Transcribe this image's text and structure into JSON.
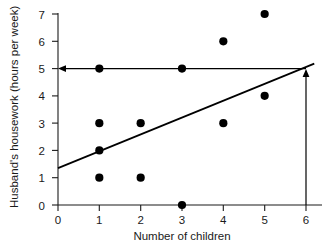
{
  "chart_data": {
    "type": "scatter",
    "title": "",
    "xlabel": "Number of children",
    "ylabel": "Husband's housework (hours per week)",
    "xlim": [
      0,
      6
    ],
    "ylim": [
      0,
      7
    ],
    "xticks": [
      "0",
      "1",
      "2",
      "3",
      "4",
      "5",
      "6"
    ],
    "yticks": [
      "0",
      "1",
      "2",
      "3",
      "4",
      "5",
      "6",
      "7"
    ],
    "grid": false,
    "legend": "none",
    "points": [
      {
        "x": 1,
        "y": 5
      },
      {
        "x": 1,
        "y": 3
      },
      {
        "x": 1,
        "y": 2
      },
      {
        "x": 1,
        "y": 1
      },
      {
        "x": 2,
        "y": 3
      },
      {
        "x": 2,
        "y": 1
      },
      {
        "x": 3,
        "y": 5
      },
      {
        "x": 3,
        "y": 0
      },
      {
        "x": 4,
        "y": 6
      },
      {
        "x": 4,
        "y": 3
      },
      {
        "x": 5,
        "y": 7
      },
      {
        "x": 5,
        "y": 4
      }
    ],
    "series": [
      {
        "name": "observations",
        "x": [
          1,
          1,
          1,
          1,
          2,
          2,
          3,
          3,
          4,
          4,
          5,
          5
        ],
        "values": [
          5,
          3,
          2,
          1,
          3,
          1,
          5,
          0,
          6,
          3,
          7,
          4
        ]
      }
    ],
    "trendline": {
      "name": "regression line",
      "x_start": 0,
      "y_start": 1.35,
      "x_end": 6.2,
      "y_end": 5.18,
      "slope": 0.617,
      "intercept": 1.35
    },
    "annotations": [
      {
        "name": "prediction-vertical-arrow",
        "from_x": 6,
        "from_y": 0,
        "to_x": 6,
        "to_y": 4.85,
        "direction": "up"
      },
      {
        "name": "prediction-horizontal-arrow",
        "from_x": 6,
        "from_y": 5,
        "to_x": 0,
        "to_y": 5,
        "direction": "left"
      }
    ],
    "colors": {
      "point": "#000000",
      "line": "#000000",
      "axis": "#1a1a1a",
      "background": "#ffffff"
    }
  }
}
